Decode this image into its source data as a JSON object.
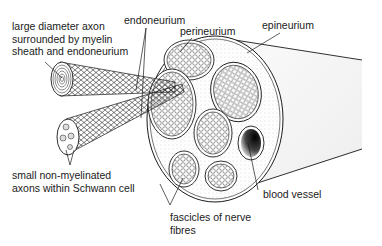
{
  "diagram": {
    "labels": {
      "large_axon_line1": "large diameter axon",
      "large_axon_line2": "surrounded by myelin",
      "large_axon_line3": "sheath and endoneurium",
      "endoneurium": "endoneurium",
      "perineurium": "perineurium",
      "epineurium": "epineurium",
      "small_axons_line1": "small non-myelinated",
      "small_axons_line2": "axons within Schwann cell",
      "blood_vessel": "blood vessel",
      "fascicles_line1": "fascicles of nerve",
      "fascicles_line2": "fibres"
    },
    "colors": {
      "ink": "#1a1a1a",
      "background": "#ffffff",
      "stipple": "#cfcfcf"
    }
  }
}
